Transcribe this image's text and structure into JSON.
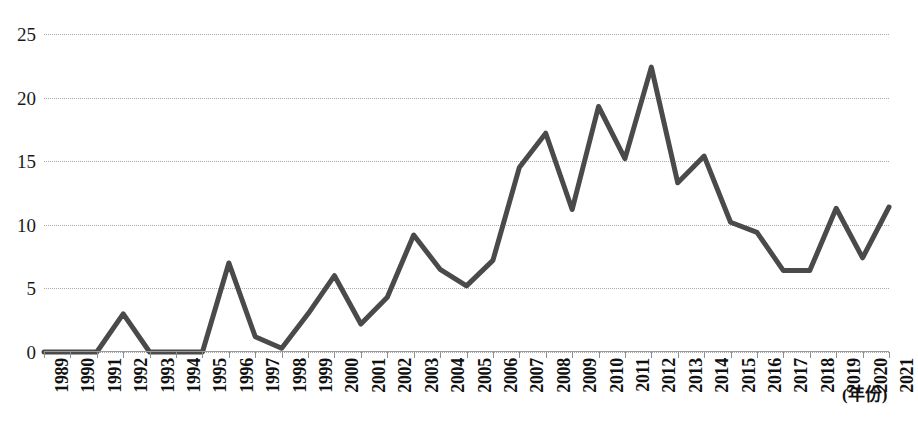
{
  "chart_data": {
    "type": "line",
    "title": "",
    "subtitle": "",
    "xlabel": "(年份)",
    "ylabel": "",
    "grid": true,
    "legend": false,
    "legend_position": "none",
    "line_color": "#4a4a4a",
    "grid_color": "#a9a9a9",
    "xlim": [
      1989,
      2021
    ],
    "ylim": [
      0,
      25
    ],
    "ytick_values": [
      0,
      5,
      10,
      15,
      20,
      25
    ],
    "ytick_labels": [
      "0",
      "5",
      "10",
      "15",
      "20",
      "25"
    ],
    "categories": [
      "1989",
      "1990",
      "1991",
      "1992",
      "1993",
      "1994",
      "1995",
      "1996",
      "1997",
      "1998",
      "1999",
      "2000",
      "2001",
      "2002",
      "2003",
      "2004",
      "2005",
      "2006",
      "2007",
      "2008",
      "2009",
      "2010",
      "2011",
      "2012",
      "2013",
      "2014",
      "2015",
      "2016",
      "2017",
      "2018",
      "2019",
      "2020",
      "2021"
    ],
    "values": [
      0,
      0,
      0,
      3,
      0,
      0,
      0,
      7,
      1.2,
      0.3,
      3,
      6,
      2.2,
      4.3,
      9.2,
      6.5,
      5.2,
      7.2,
      14.5,
      17.2,
      11.2,
      19.3,
      15.2,
      22.4,
      13.3,
      15.4,
      10.2,
      9.4,
      6.4,
      6.4,
      11.3,
      7.4,
      11.4
    ],
    "series": [
      {
        "name": "",
        "values": [
          0,
          0,
          0,
          3,
          0,
          0,
          0,
          7,
          1.2,
          0.3,
          3,
          6,
          2.2,
          4.3,
          9.2,
          6.5,
          5.2,
          7.2,
          14.5,
          17.2,
          11.2,
          19.3,
          15.2,
          22.4,
          13.3,
          15.4,
          10.2,
          9.4,
          6.4,
          6.4,
          11.3,
          7.4,
          11.4
        ]
      }
    ]
  }
}
